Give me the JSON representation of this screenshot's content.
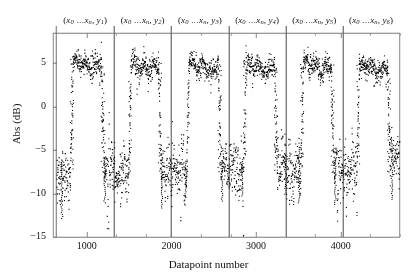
{
  "chart_data": {
    "type": "scatter",
    "title": "",
    "xlabel": "Datapoint number",
    "ylabel": "Abs (dB)",
    "xlim": [
      600,
      4700
    ],
    "ylim": [
      -15,
      8.5
    ],
    "xticks": [
      1000,
      2000,
      3000,
      4000
    ],
    "xtick_labels": [
      "1000",
      "2000",
      "3000",
      "4000"
    ],
    "xminorticks": [
      1350,
      1700,
      2350,
      2700,
      3350,
      3700,
      4350,
      4700
    ],
    "yticks": [
      5,
      0,
      -5,
      -10,
      -15
    ],
    "ytick_labels": [
      "5",
      "0",
      "−5",
      "−10",
      "−15"
    ],
    "grid": false,
    "legend": null,
    "marker": "dotted-square",
    "marker_color": "#000000",
    "separator_color": "#6e6e6e",
    "axis_color": "#7a7a7a",
    "group_labels": [
      "(x0 ...xn, y1)",
      "(x0 ...xn, y2)",
      "(x0 ...xn, y3)",
      "(x0 ...xn, y4)",
      "(x0 ...xn, y5)",
      "(x0 ...xn, y6)"
    ],
    "group_label_parts": [
      {
        "var1": "x",
        "sub1": "0",
        "dots": "...",
        "var2": "x",
        "sub2": "n",
        "var3": "y",
        "sub3": "1"
      },
      {
        "var1": "x",
        "sub1": "0",
        "dots": "...",
        "var2": "x",
        "sub2": "n",
        "var3": "y",
        "sub3": "2"
      },
      {
        "var1": "x",
        "sub1": "0",
        "dots": "...",
        "var2": "x",
        "sub2": "n",
        "var3": "y",
        "sub3": "3"
      },
      {
        "var1": "x",
        "sub1": "0",
        "dots": "...",
        "var2": "x",
        "sub2": "n",
        "var3": "y",
        "sub3": "4"
      },
      {
        "var1": "x",
        "sub1": "0",
        "dots": "...",
        "var2": "x",
        "sub2": "n",
        "var3": "y",
        "sub3": "5"
      },
      {
        "var1": "x",
        "sub1": "0",
        "dots": "...",
        "var2": "x",
        "sub2": "n",
        "var3": "y",
        "sub3": "6"
      }
    ],
    "group_boundaries": [
      640,
      1322,
      1998,
      2674,
      3350,
      4026,
      4690
    ],
    "segments": [
      {
        "group": 1,
        "x_start": 640,
        "x_end": 800,
        "level": -8.2,
        "spread": 2.6,
        "kind": "low"
      },
      {
        "group": 1,
        "x_start": 800,
        "x_end": 835,
        "level": -1.0,
        "spread": 6.6,
        "kind": "transition-up"
      },
      {
        "group": 1,
        "x_start": 835,
        "x_end": 1165,
        "level": 4.9,
        "spread": 1.5,
        "kind": "high"
      },
      {
        "group": 1,
        "x_start": 1165,
        "x_end": 1200,
        "level": -1.0,
        "spread": 6.6,
        "kind": "transition-down"
      },
      {
        "group": 1,
        "x_start": 1200,
        "x_end": 1322,
        "level": -7.1,
        "spread": 2.9,
        "kind": "low"
      },
      {
        "group": 2,
        "x_start": 1322,
        "x_end": 1490,
        "level": -7.6,
        "spread": 2.8,
        "kind": "low"
      },
      {
        "group": 2,
        "x_start": 1490,
        "x_end": 1520,
        "level": -1.2,
        "spread": 6.5,
        "kind": "transition-up"
      },
      {
        "group": 2,
        "x_start": 1520,
        "x_end": 1840,
        "level": 4.7,
        "spread": 1.4,
        "kind": "high"
      },
      {
        "group": 2,
        "x_start": 1840,
        "x_end": 1875,
        "level": -1.2,
        "spread": 6.5,
        "kind": "transition-down"
      },
      {
        "group": 2,
        "x_start": 1875,
        "x_end": 1998,
        "level": -8.1,
        "spread": 3.0,
        "kind": "low"
      },
      {
        "group": 3,
        "x_start": 1998,
        "x_end": 2175,
        "level": -7.4,
        "spread": 2.7,
        "kind": "low"
      },
      {
        "group": 3,
        "x_start": 2175,
        "x_end": 2205,
        "level": -1.0,
        "spread": 6.6,
        "kind": "transition-up"
      },
      {
        "group": 3,
        "x_start": 2205,
        "x_end": 2545,
        "level": 4.7,
        "spread": 1.3,
        "kind": "high"
      },
      {
        "group": 3,
        "x_start": 2545,
        "x_end": 2580,
        "level": -1.0,
        "spread": 6.6,
        "kind": "transition-down"
      },
      {
        "group": 3,
        "x_start": 2580,
        "x_end": 2674,
        "level": -7.4,
        "spread": 2.6,
        "kind": "low"
      },
      {
        "group": 4,
        "x_start": 2674,
        "x_end": 2845,
        "level": -7.2,
        "spread": 2.7,
        "kind": "low"
      },
      {
        "group": 4,
        "x_start": 2845,
        "x_end": 2875,
        "level": -1.0,
        "spread": 6.5,
        "kind": "transition-up"
      },
      {
        "group": 4,
        "x_start": 2875,
        "x_end": 3210,
        "level": 4.7,
        "spread": 1.3,
        "kind": "high"
      },
      {
        "group": 4,
        "x_start": 3210,
        "x_end": 3245,
        "level": -1.0,
        "spread": 6.5,
        "kind": "transition-down"
      },
      {
        "group": 4,
        "x_start": 3245,
        "x_end": 3350,
        "level": -6.6,
        "spread": 2.6,
        "kind": "low"
      },
      {
        "group": 5,
        "x_start": 3350,
        "x_end": 3520,
        "level": -7.4,
        "spread": 3.0,
        "kind": "low"
      },
      {
        "group": 5,
        "x_start": 3520,
        "x_end": 3555,
        "level": -1.2,
        "spread": 6.4,
        "kind": "transition-up"
      },
      {
        "group": 5,
        "x_start": 3555,
        "x_end": 3880,
        "level": 4.8,
        "spread": 1.4,
        "kind": "high"
      },
      {
        "group": 5,
        "x_start": 3880,
        "x_end": 3915,
        "level": -1.2,
        "spread": 6.4,
        "kind": "transition-down"
      },
      {
        "group": 5,
        "x_start": 3915,
        "x_end": 4026,
        "level": -7.6,
        "spread": 2.8,
        "kind": "low"
      },
      {
        "group": 6,
        "x_start": 4026,
        "x_end": 4185,
        "level": -7.6,
        "spread": 2.8,
        "kind": "low"
      },
      {
        "group": 6,
        "x_start": 4185,
        "x_end": 4215,
        "level": -1.2,
        "spread": 6.4,
        "kind": "transition-up"
      },
      {
        "group": 6,
        "x_start": 4215,
        "x_end": 4545,
        "level": 4.6,
        "spread": 1.3,
        "kind": "high"
      },
      {
        "group": 6,
        "x_start": 4545,
        "x_end": 4580,
        "level": -1.2,
        "spread": 6.4,
        "kind": "transition-down"
      },
      {
        "group": 6,
        "x_start": 4580,
        "x_end": 4690,
        "level": -5.9,
        "spread": 2.1,
        "kind": "low"
      }
    ]
  }
}
